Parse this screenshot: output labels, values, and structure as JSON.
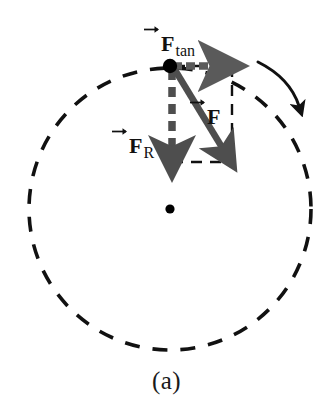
{
  "figure": {
    "caption": "(a)",
    "background_color": "#ffffff",
    "width": 333,
    "height": 413
  },
  "labels": {
    "tangential_force": {
      "symbol": "F",
      "subscript": "tan",
      "has_vector_arrow": true
    },
    "radial_force": {
      "symbol": "F",
      "subscript": "R",
      "has_vector_arrow": true
    },
    "net_force": {
      "symbol": "F",
      "subscript": "",
      "has_vector_arrow": true
    }
  },
  "colors": {
    "vector_gray": "#5a5a5a",
    "construction_black": "#111111",
    "circle_black": "#111111",
    "particle_black": "#000000"
  },
  "geometry": {
    "circle": {
      "cx": 170,
      "cy": 209,
      "r": 141,
      "dash": "15 13",
      "stroke_width": 3.6
    },
    "center_dot": {
      "cx": 170,
      "cy": 209,
      "r": 4.6
    },
    "particle_dot": {
      "cx": 170,
      "cy": 66,
      "r": 7.2
    },
    "tangential_vector": {
      "x1": 172,
      "y1": 66,
      "x2": 228,
      "y2": 66
    },
    "radial_vector": {
      "x1": 172,
      "y1": 70,
      "x2": 172,
      "y2": 162
    },
    "net_force_vector": {
      "x1": 175,
      "y1": 70,
      "x2": 232,
      "y2": 162
    },
    "construction_rect": {
      "left": 172,
      "top": 66,
      "right": 232,
      "bottom": 162
    },
    "motion_arc": {
      "start_x": 258,
      "start_y": 62,
      "end_x": 300,
      "end_y": 111
    }
  }
}
